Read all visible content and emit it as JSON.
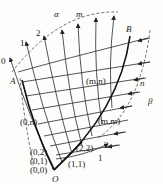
{
  "diagram": {
    "type": "characteristic-grid",
    "labels": {
      "alpha": "α",
      "beta": "β",
      "m": "m",
      "n": "n",
      "A": "A",
      "B": "B",
      "O": "O",
      "alpha_lines": [
        "0",
        "1",
        "2"
      ],
      "beta_lines": [
        "1",
        "2"
      ],
      "nodes": {
        "p00": "(0,0)",
        "p01": "(0,1)",
        "p02": "(0,2)",
        "p0n": "(0,n)",
        "p11": "(1,1)",
        "p22": "(2,2)",
        "pmm": "(m,m)",
        "pmn": "(m,n)"
      }
    },
    "colors": {
      "line": "#222222",
      "background": "#fdfdfb"
    }
  }
}
